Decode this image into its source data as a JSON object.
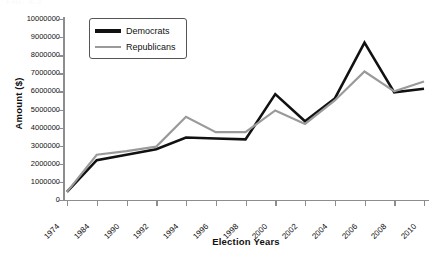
{
  "scan": {
    "header_fragment": "FIG. 4.2"
  },
  "chart_data": {
    "type": "line",
    "title": "",
    "xlabel": "Election Years",
    "ylabel": "Amount ($)",
    "categories": [
      "1974",
      "1984",
      "1990",
      "1992",
      "1994",
      "1996",
      "1998",
      "2000",
      "2002",
      "2004",
      "2006",
      "2008",
      "2010"
    ],
    "ylim": [
      0,
      10000000
    ],
    "ytick_step": 1000000,
    "yticks": [
      "10000000",
      "9000000",
      "8000000",
      "7000000",
      "6000000",
      "5000000",
      "4000000",
      "3000000",
      "2000000",
      "1000000",
      "0"
    ],
    "ytick_values": [
      10000000,
      9000000,
      8000000,
      7000000,
      6000000,
      5000000,
      4000000,
      3000000,
      2000000,
      1000000,
      0
    ],
    "grid": false,
    "legend_position": "top-left",
    "series": [
      {
        "name": "Democrats",
        "color": "#111111",
        "width": 2.6,
        "values": [
          450000,
          2200000,
          2500000,
          2800000,
          3450000,
          3400000,
          3350000,
          5850000,
          4350000,
          5600000,
          8700000,
          5950000,
          6150000
        ]
      },
      {
        "name": "Republicans",
        "color": "#9a9a9a",
        "width": 2.2,
        "values": [
          450000,
          2500000,
          2700000,
          2950000,
          4600000,
          3750000,
          3750000,
          4950000,
          4200000,
          5500000,
          7100000,
          6000000,
          6550000
        ]
      }
    ]
  }
}
